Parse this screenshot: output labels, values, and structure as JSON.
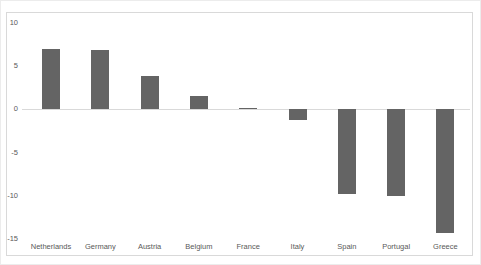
{
  "chart_data": {
    "type": "bar",
    "title": "",
    "xlabel": "",
    "ylabel": "",
    "categories": [
      "Netherlands",
      "Germany",
      "Austria",
      "Belgium",
      "France",
      "Italy",
      "Spain",
      "Portugal",
      "Greece"
    ],
    "values": [
      7.0,
      6.9,
      3.9,
      1.6,
      0.2,
      -1.2,
      -9.8,
      -10.0,
      -14.3
    ],
    "series": [
      {
        "name": "",
        "values": [
          7.0,
          6.9,
          3.9,
          1.6,
          0.2,
          -1.2,
          -9.8,
          -10.0,
          -14.3
        ]
      }
    ],
    "ylim": [
      -15,
      10
    ],
    "yticks": [
      10,
      5,
      0,
      -5,
      -10,
      -15
    ],
    "grid": "off",
    "legend_position": "none",
    "zero_axis_line": true,
    "colors": {
      "bar": "#646464",
      "axis_line": "#d9d9d9",
      "frame_border": "#d9d9d9",
      "tick_label": "#595959"
    }
  }
}
